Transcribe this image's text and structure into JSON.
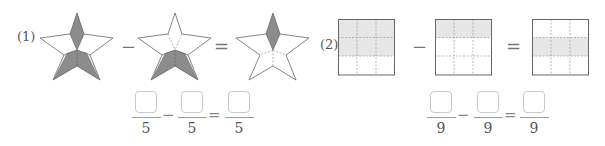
{
  "problems": [
    {
      "label": "(1)",
      "shape": "star",
      "parts": 5,
      "figures": [
        {
          "shaded_parts": 3,
          "shaded": [
            "top",
            "bottom-left",
            "bottom-right"
          ]
        },
        {
          "shaded_parts": 2,
          "shaded": [
            "bottom-left",
            "bottom-right"
          ]
        },
        {
          "shaded_parts": 1,
          "shaded": [
            "top"
          ]
        }
      ],
      "operators": [
        "−",
        "="
      ],
      "equation": {
        "numerators": [
          "",
          "",
          ""
        ],
        "denominators": [
          "5",
          "5",
          "5"
        ],
        "operators": [
          "−",
          "="
        ]
      }
    },
    {
      "label": "(2)",
      "shape": "square-grid-3x3",
      "parts": 9,
      "figures": [
        {
          "shaded_parts": 6,
          "shaded_rows": [
            0,
            1
          ]
        },
        {
          "shaded_parts": 3,
          "shaded_rows": [
            0
          ]
        },
        {
          "shaded_parts": 3,
          "shaded_rows": [
            1
          ]
        }
      ],
      "operators": [
        "−",
        "="
      ],
      "equation": {
        "numerators": [
          "",
          "",
          ""
        ],
        "denominators": [
          "9",
          "9",
          "9"
        ],
        "operators": [
          "−",
          "="
        ]
      }
    }
  ],
  "colors": {
    "shade_star": "#8c8c8c",
    "shade_grid": "#e6e6e6",
    "outline": "#666666",
    "answer_box": "#c9c9c9"
  }
}
